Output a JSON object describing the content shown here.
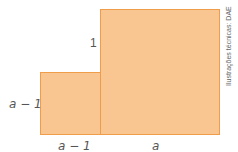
{
  "diagram": {
    "shapes": [
      {
        "id": "big-square",
        "side": "a",
        "fill": "#f9c590",
        "stroke": "#ef9d4b"
      },
      {
        "id": "small-square",
        "side": "a − 1",
        "fill": "#f9c590",
        "stroke": "#ef9d4b"
      }
    ],
    "labels": {
      "small_height": "a − 1",
      "small_width": "a − 1",
      "big_width": "a",
      "step_height": "1"
    },
    "credit": "Ilustrações técnicas: DAE"
  }
}
